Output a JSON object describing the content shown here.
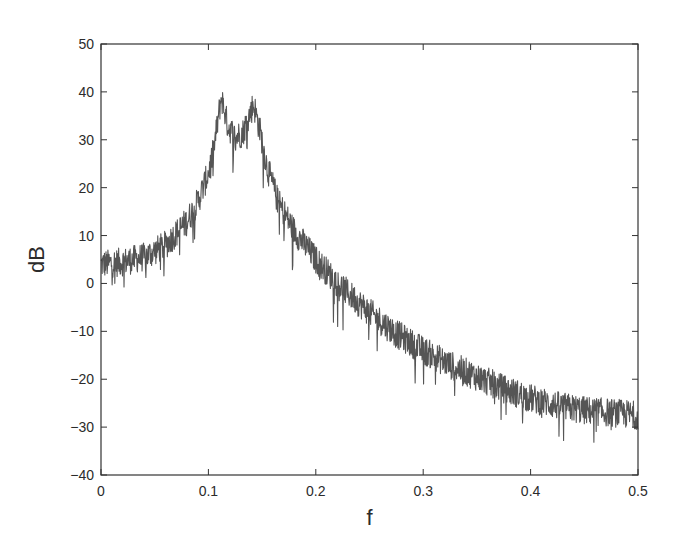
{
  "chart_data": {
    "type": "line",
    "title": "",
    "xlabel": "f",
    "ylabel": "dB",
    "xlim": [
      0,
      0.5
    ],
    "ylim": [
      -40,
      50
    ],
    "xticks": [
      0,
      0.1,
      0.2,
      0.3,
      0.4,
      0.5
    ],
    "xtick_labels": [
      "0",
      "0.1",
      "0.2",
      "0.3",
      "0.4",
      "0.5"
    ],
    "yticks": [
      -40,
      -30,
      -20,
      -10,
      0,
      10,
      20,
      30,
      40,
      50
    ],
    "ytick_labels": [
      "−40",
      "−30",
      "−20",
      "−10",
      "0",
      "10",
      "20",
      "30",
      "40",
      "50"
    ],
    "grid": false,
    "legend": null,
    "line_color": "#555555",
    "series": [
      {
        "name": "spectrum",
        "description": "Noisy power spectrum with two resonant peaks near f=0.112 (~41 dB) and f=0.142 (~38 dB); noise band roughly ±3 dB around mean",
        "x": [
          0.0,
          0.02,
          0.04,
          0.06,
          0.08,
          0.09,
          0.1,
          0.105,
          0.112,
          0.118,
          0.125,
          0.132,
          0.138,
          0.142,
          0.148,
          0.155,
          0.165,
          0.18,
          0.2,
          0.225,
          0.25,
          0.275,
          0.3,
          0.325,
          0.35,
          0.375,
          0.4,
          0.425,
          0.45,
          0.475,
          0.5
        ],
        "values": [
          4.0,
          4.5,
          5.5,
          8.0,
          13.0,
          17.0,
          23.0,
          28.0,
          39.0,
          33.0,
          30.5,
          31.5,
          35.0,
          37.5,
          32.0,
          24.0,
          17.0,
          11.0,
          5.0,
          -1.0,
          -6.0,
          -10.5,
          -14.0,
          -17.0,
          -19.5,
          -22.0,
          -24.0,
          -25.5,
          -26.5,
          -27.0,
          -27.5
        ],
        "noise_amplitude_db": 3.0
      }
    ]
  }
}
